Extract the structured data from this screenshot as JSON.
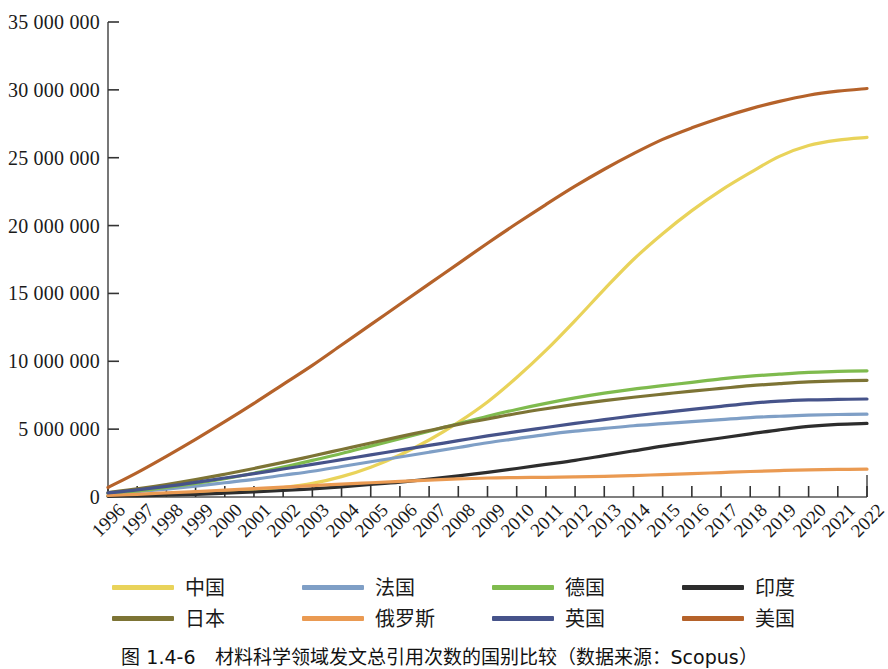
{
  "chart_data": {
    "type": "line",
    "title": "",
    "xlabel": "",
    "ylabel": "",
    "grid": false,
    "legend_position": "bottom",
    "xlim": [
      1996,
      2022
    ],
    "ylim": [
      0,
      35000000
    ],
    "ytick_labels": [
      "35 000 000",
      "30 000 000",
      "25 000 000",
      "20 000 000",
      "15 000 000",
      "10 000 000",
      "5 000 000",
      "0"
    ],
    "ytick_values": [
      35000000,
      30000000,
      25000000,
      20000000,
      15000000,
      10000000,
      5000000,
      0
    ],
    "categories": [
      "1996",
      "1997",
      "1998",
      "1999",
      "2000",
      "2001",
      "2002",
      "2003",
      "2004",
      "2005",
      "2006",
      "2007",
      "2008",
      "2009",
      "2010",
      "2011",
      "2012",
      "2013",
      "2014",
      "2015",
      "2016",
      "2017",
      "2018",
      "2019",
      "2020",
      "2021",
      "2022"
    ],
    "series": [
      {
        "name": "中国",
        "key": "china",
        "color": "#e9d35a",
        "values": [
          90000,
          130000,
          180000,
          250000,
          350000,
          500000,
          700000,
          1000000,
          1500000,
          2200000,
          3100000,
          4200000,
          5500000,
          7000000,
          8800000,
          10800000,
          13000000,
          15300000,
          17500000,
          19400000,
          21100000,
          22600000,
          23900000,
          25100000,
          25900000,
          26300000,
          26500000
        ]
      },
      {
        "name": "法国",
        "key": "france",
        "color": "#7f9fc6",
        "values": [
          250000,
          400000,
          580000,
          800000,
          1050000,
          1300000,
          1600000,
          1900000,
          2250000,
          2600000,
          2950000,
          3300000,
          3650000,
          4000000,
          4300000,
          4600000,
          4850000,
          5050000,
          5250000,
          5400000,
          5550000,
          5700000,
          5850000,
          5950000,
          6030000,
          6080000,
          6100000
        ]
      },
      {
        "name": "德国",
        "key": "germany",
        "color": "#7fbb4e",
        "values": [
          260000,
          450000,
          700000,
          1000000,
          1350000,
          1750000,
          2200000,
          2700000,
          3200000,
          3750000,
          4300000,
          4850000,
          5400000,
          5950000,
          6450000,
          6900000,
          7300000,
          7650000,
          7950000,
          8200000,
          8450000,
          8700000,
          8900000,
          9050000,
          9180000,
          9250000,
          9300000
        ]
      },
      {
        "name": "印度",
        "key": "india",
        "color": "#2d2d2d",
        "values": [
          50000,
          90000,
          140000,
          200000,
          280000,
          370000,
          480000,
          600000,
          750000,
          920000,
          1100000,
          1320000,
          1560000,
          1820000,
          2100000,
          2400000,
          2700000,
          3050000,
          3400000,
          3750000,
          4050000,
          4350000,
          4650000,
          4950000,
          5200000,
          5350000,
          5420000
        ]
      },
      {
        "name": "日本",
        "key": "japan",
        "color": "#7d7435",
        "values": [
          330000,
          600000,
          920000,
          1280000,
          1680000,
          2100000,
          2550000,
          3020000,
          3500000,
          3980000,
          4450000,
          4900000,
          5350000,
          5750000,
          6150000,
          6500000,
          6820000,
          7100000,
          7350000,
          7580000,
          7800000,
          8000000,
          8200000,
          8350000,
          8480000,
          8560000,
          8600000
        ]
      },
      {
        "name": "俄罗斯",
        "key": "russia",
        "color": "#ea9a52",
        "values": [
          110000,
          200000,
          300000,
          400000,
          510000,
          620000,
          730000,
          840000,
          950000,
          1050000,
          1150000,
          1250000,
          1330000,
          1400000,
          1430000,
          1450000,
          1480000,
          1520000,
          1580000,
          1650000,
          1720000,
          1800000,
          1880000,
          1950000,
          2000000,
          2030000,
          2050000
        ]
      },
      {
        "name": "英国",
        "key": "uk",
        "color": "#46538a",
        "values": [
          300000,
          520000,
          780000,
          1080000,
          1400000,
          1720000,
          2060000,
          2400000,
          2750000,
          3100000,
          3450000,
          3800000,
          4150000,
          4500000,
          4820000,
          5120000,
          5420000,
          5700000,
          5980000,
          6220000,
          6450000,
          6680000,
          6900000,
          7060000,
          7150000,
          7190000,
          7220000
        ]
      },
      {
        "name": "美国",
        "key": "usa",
        "color": "#b5622a",
        "values": [
          700000,
          1800000,
          3000000,
          4250000,
          5550000,
          6900000,
          8300000,
          9700000,
          11200000,
          12700000,
          14200000,
          15700000,
          17200000,
          18700000,
          20150000,
          21550000,
          22900000,
          24150000,
          25300000,
          26350000,
          27200000,
          27950000,
          28600000,
          29150000,
          29600000,
          29900000,
          30100000
        ]
      }
    ]
  },
  "legend": {
    "rows": [
      [
        {
          "label": "中国",
          "color": "#e9d35a",
          "name": "legend-item-china"
        },
        {
          "label": "法国",
          "color": "#7f9fc6",
          "name": "legend-item-france"
        },
        {
          "label": "德国",
          "color": "#7fbb4e",
          "name": "legend-item-germany"
        },
        {
          "label": "印度",
          "color": "#2d2d2d",
          "name": "legend-item-india"
        }
      ],
      [
        {
          "label": "日本",
          "color": "#7d7435",
          "name": "legend-item-japan"
        },
        {
          "label": "俄罗斯",
          "color": "#ea9a52",
          "name": "legend-item-russia"
        },
        {
          "label": "英国",
          "color": "#46538a",
          "name": "legend-item-uk"
        },
        {
          "label": "美国",
          "color": "#b5622a",
          "name": "legend-item-usa"
        }
      ]
    ]
  },
  "caption": {
    "text": "图 1.4-6　材料科学领域发文总引用次数的国别比较（数据来源：Scopus）"
  },
  "axis": {
    "line_color": "#555555",
    "tick_color": "#333333"
  }
}
